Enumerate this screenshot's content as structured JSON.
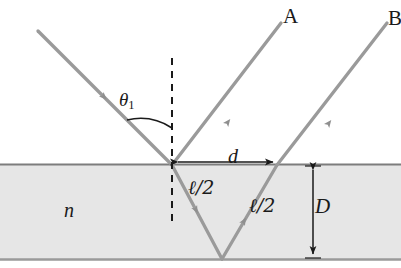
{
  "figure": {
    "type": "optics-ray-diagram",
    "colors": {
      "ray": "#999999",
      "slab_fill": "#e6e6e6",
      "slab_border": "#808080",
      "label": "#1a1a1a",
      "background": "#ffffff"
    }
  },
  "labels": {
    "ray_a": "A",
    "ray_b": "B",
    "angle_incidence": "θ",
    "angle_incidence_sub": "1",
    "separation": "d",
    "path_half_left": "ℓ/2",
    "path_half_right": "ℓ/2",
    "thickness": "D",
    "refractive_index": "n"
  },
  "geometry": {
    "slab_top_y": 164,
    "slab_bottom_y": 259,
    "incidence_point": [
      172,
      165
    ],
    "bottom_vertex": [
      222,
      259
    ],
    "exit_point_b": [
      277,
      165
    ],
    "normal_x": 172,
    "normal_top_y": 58,
    "normal_bottom_y": 222,
    "d_arrow_y": 163,
    "d_arrow_x1": 176,
    "d_arrow_x2": 275,
    "D_arrow_x": 313,
    "incident_start": [
      38,
      31
    ],
    "ray_a_end": [
      280,
      22
    ],
    "ray_b_end": [
      385,
      22
    ]
  }
}
